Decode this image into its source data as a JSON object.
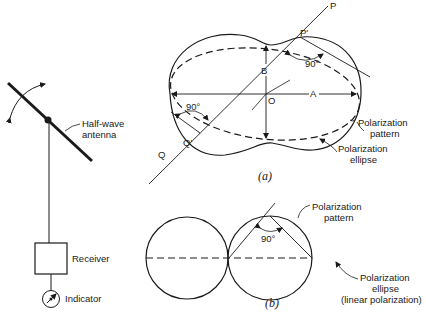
{
  "left_setup": {
    "antenna_label_line1": "Half-wave",
    "antenna_label_line2": "antenna",
    "receiver_label": "Receiver",
    "indicator_label": "Indicator"
  },
  "figure_a": {
    "caption": "(a)",
    "point_P": "P",
    "point_P_prime": "P'",
    "point_O": "O",
    "point_Q": "Q",
    "point_Q_prime": "Q'",
    "axis_A": "A",
    "axis_B": "B",
    "angle_upper": "90°",
    "angle_lower": "90°",
    "pattern_label_line1": "Polarization",
    "pattern_label_line2": "pattern",
    "ellipse_label_line1": "Polarization",
    "ellipse_label_line2": "ellipse"
  },
  "figure_b": {
    "caption": "(b)",
    "angle": "90°",
    "pattern_label_line1": "Polarization",
    "pattern_label_line2": "pattern",
    "ellipse_label_line1": "Polarization",
    "ellipse_label_line2": "ellipse",
    "ellipse_label_line3": "(linear polarization)"
  }
}
